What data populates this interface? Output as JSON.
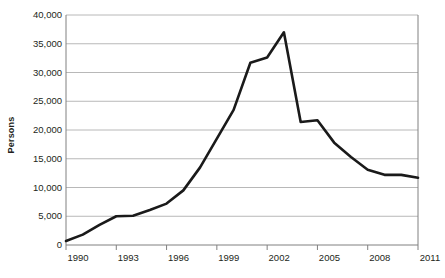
{
  "chart_data": {
    "type": "line",
    "title": "",
    "xlabel": "",
    "ylabel": "Persons",
    "ylim": [
      0,
      40000
    ],
    "xlim": [
      1990,
      2011
    ],
    "grid": true,
    "legend": false,
    "y_ticks": [
      "40,000",
      "35,000",
      "30,000",
      "25,000",
      "20,000",
      "15,000",
      "10,000",
      "5,000",
      "0"
    ],
    "y_tick_values": [
      40000,
      35000,
      30000,
      25000,
      20000,
      15000,
      10000,
      5000,
      0
    ],
    "x_ticks": [
      "1990",
      "1993",
      "1996",
      "1999",
      "2002",
      "2005",
      "2008",
      "2011"
    ],
    "x_tick_values": [
      1990,
      1993,
      1996,
      1999,
      2002,
      2005,
      2008,
      2011
    ],
    "x": [
      1990,
      1991,
      1992,
      1993,
      1994,
      1995,
      1996,
      1997,
      1998,
      1999,
      2000,
      2001,
      2002,
      2003,
      2004,
      2005,
      2006,
      2007,
      2008,
      2009,
      2010,
      2011
    ],
    "values": [
      700,
      1800,
      3500,
      5000,
      5100,
      6100,
      7200,
      9500,
      13500,
      18500,
      23500,
      31700,
      32600,
      37000,
      21400,
      21700,
      17800,
      15300,
      13100,
      12200,
      12200,
      11700
    ],
    "series": [
      {
        "name": "Persons",
        "color": "#1a1a1a",
        "values": [
          700,
          1800,
          3500,
          5000,
          5100,
          6100,
          7200,
          9500,
          13500,
          18500,
          23500,
          31700,
          32600,
          37000,
          21400,
          21700,
          17800,
          15300,
          13100,
          12200,
          12200,
          11700
        ]
      }
    ],
    "line_color": "#1a1a1a",
    "line_width": 2.6,
    "grid_color": "#a6a6a6",
    "axis_color": "#808080",
    "background": "#ffffff"
  }
}
